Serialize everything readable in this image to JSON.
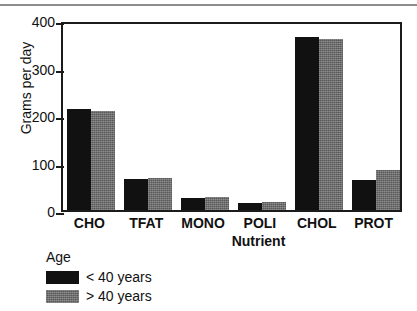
{
  "chart_data": {
    "type": "bar",
    "title": "",
    "xlabel": "Nutrient",
    "ylabel": "Grams per day",
    "categories": [
      "CHO",
      "TFAT",
      "MONO",
      "POLI",
      "CHOL",
      "PROT"
    ],
    "series": [
      {
        "name": "< 40 years",
        "color": "#111111",
        "values": [
          213,
          65,
          25,
          14,
          365,
          63
        ]
      },
      {
        "name": "> 40 years",
        "color": "#6b6b6b",
        "values": [
          208,
          68,
          27,
          16,
          361,
          84
        ]
      }
    ],
    "ylim": [
      0,
      400
    ],
    "yticks": [
      0,
      100,
      200,
      300,
      400
    ],
    "ytick_labels": [
      "0",
      "100",
      "200",
      "300",
      "400"
    ],
    "grid": false,
    "legend_position": "below-left",
    "legend_title": "Age"
  },
  "axes": {
    "y_label": "Grams per day",
    "x_label": "Nutrient",
    "y_tick_labels": [
      "400",
      "300",
      "200",
      "100",
      "0"
    ]
  },
  "legend": {
    "title": "Age",
    "entries": [
      {
        "label": "< 40 years",
        "swatch": "black-swatch"
      },
      {
        "label": "> 40 years",
        "swatch": "gray-swatch"
      }
    ]
  }
}
